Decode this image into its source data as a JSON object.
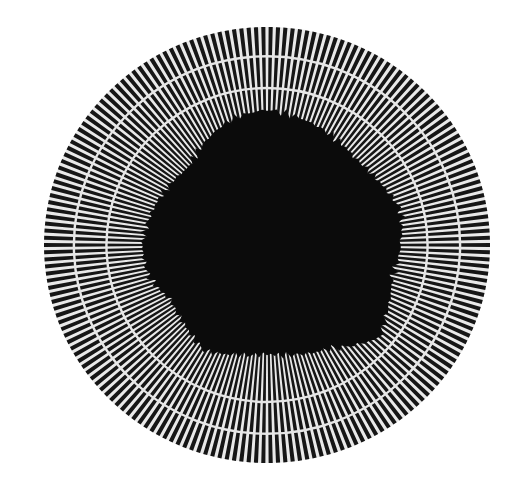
{
  "canvas": {
    "width": 522,
    "height": 493,
    "background": "#ffffff"
  },
  "target": {
    "description": "Radial spoke target photograph with two concentric rings and a dark irregular central region",
    "center": {
      "x": 267,
      "y": 245
    },
    "outer_radius_x": 223,
    "outer_radius_y": 218,
    "spoke_count": 190,
    "spoke_duty": 0.56,
    "spoke_color": "#161616",
    "gap_color": "#e9e9e9",
    "rings": [
      {
        "name": "outer-ring",
        "radius_fraction": 0.866,
        "width": 2.4,
        "color": "#e6e6e6"
      },
      {
        "name": "inner-ring",
        "radius_fraction": 0.72,
        "width": 2.4,
        "color": "#e6e6e6"
      }
    ],
    "core": {
      "color": "#0b0b0b",
      "radius_profile_fraction": [
        {
          "deg": 0,
          "r": 0.6
        },
        {
          "deg": 15,
          "r": 0.58
        },
        {
          "deg": 30,
          "r": 0.62
        },
        {
          "deg": 40,
          "r": 0.66
        },
        {
          "deg": 50,
          "r": 0.6
        },
        {
          "deg": 60,
          "r": 0.55
        },
        {
          "deg": 75,
          "r": 0.52
        },
        {
          "deg": 90,
          "r": 0.5
        },
        {
          "deg": 105,
          "r": 0.52
        },
        {
          "deg": 120,
          "r": 0.56
        },
        {
          "deg": 135,
          "r": 0.52
        },
        {
          "deg": 150,
          "r": 0.5
        },
        {
          "deg": 165,
          "r": 0.55
        },
        {
          "deg": 180,
          "r": 0.56
        },
        {
          "deg": 195,
          "r": 0.54
        },
        {
          "deg": 210,
          "r": 0.52
        },
        {
          "deg": 225,
          "r": 0.5
        },
        {
          "deg": 240,
          "r": 0.55
        },
        {
          "deg": 255,
          "r": 0.6
        },
        {
          "deg": 270,
          "r": 0.62
        },
        {
          "deg": 285,
          "r": 0.6
        },
        {
          "deg": 300,
          "r": 0.58
        },
        {
          "deg": 315,
          "r": 0.56
        },
        {
          "deg": 330,
          "r": 0.58
        },
        {
          "deg": 345,
          "r": 0.62
        },
        {
          "deg": 360,
          "r": 0.6
        }
      ]
    }
  }
}
